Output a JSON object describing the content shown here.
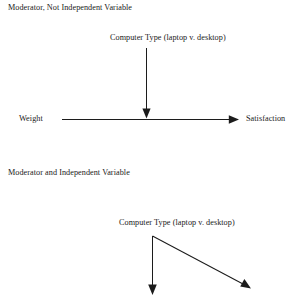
{
  "document": {
    "background_color": "#ffffff",
    "ink_color": "#1a1a1a"
  },
  "diagrams": [
    {
      "heading": "Moderator, Not Independent Variable",
      "moderator_label": "Computer Type (laptop v. desktop)",
      "predictor_label": "Weight",
      "outcome_label": "Satisfaction"
    },
    {
      "heading": "Moderator and Independent Variable",
      "moderator_label": "Computer Type (laptop v. desktop)"
    }
  ]
}
